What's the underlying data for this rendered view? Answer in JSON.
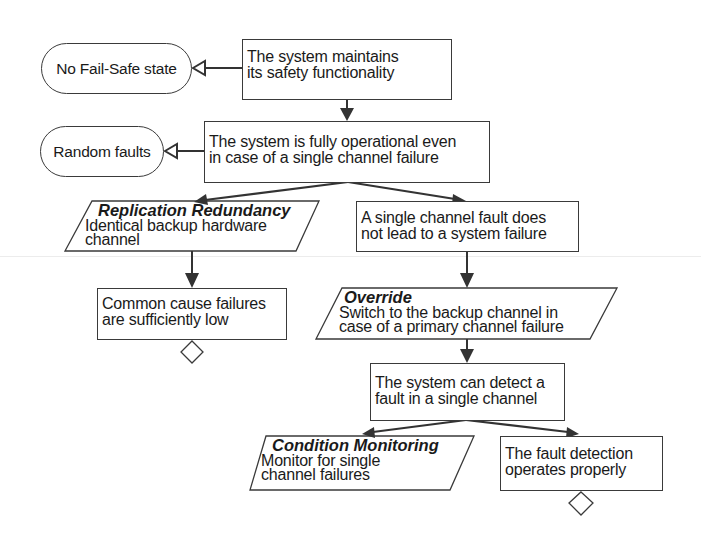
{
  "diagram": {
    "type": "safety-pattern-flowchart",
    "nodes": {
      "no_failsafe": {
        "label": "No Fail-Safe state",
        "shape": "terminator"
      },
      "random_faults": {
        "label": "Random faults",
        "shape": "terminator"
      },
      "maintains": {
        "line1": "The system maintains",
        "line2": "its safety functionality",
        "shape": "rectangle"
      },
      "fully_operational": {
        "line1": "The system is fully operational even",
        "line2": "in case of a single channel failure",
        "shape": "rectangle"
      },
      "replication": {
        "title": "Replication Redundancy",
        "line1": "Identical backup hardware",
        "line2": "channel",
        "shape": "parallelogram"
      },
      "single_fault": {
        "line1": "A single channel fault does",
        "line2": "not lead to a system failure",
        "shape": "rectangle"
      },
      "common_cause": {
        "line1": "Common cause failures",
        "line2": "are sufficiently low",
        "shape": "rectangle"
      },
      "override": {
        "title": "Override",
        "line1": "Switch to the backup channel in",
        "line2": "case of a primary channel failure",
        "shape": "parallelogram"
      },
      "detect": {
        "line1": "The system can detect a",
        "line2": "fault in a single channel",
        "shape": "rectangle"
      },
      "condition_monitoring": {
        "title": "Condition Monitoring",
        "line1": "Monitor for single",
        "line2": "channel failures",
        "shape": "parallelogram"
      },
      "fault_detection_ok": {
        "line1": "The fault detection",
        "line2": "operates properly",
        "shape": "rectangle"
      }
    },
    "edges": [
      {
        "from": "maintains",
        "to": "no_failsafe",
        "style": "hollow-triangle"
      },
      {
        "from": "maintains",
        "to": "fully_operational",
        "style": "filled-arrow"
      },
      {
        "from": "fully_operational",
        "to": "random_faults",
        "style": "hollow-triangle"
      },
      {
        "from": "fully_operational",
        "to": "replication",
        "style": "filled-arrow"
      },
      {
        "from": "fully_operational",
        "to": "single_fault",
        "style": "filled-arrow"
      },
      {
        "from": "replication",
        "to": "common_cause",
        "style": "filled-arrow"
      },
      {
        "from": "single_fault",
        "to": "override",
        "style": "filled-arrow"
      },
      {
        "from": "override",
        "to": "detect",
        "style": "filled-arrow"
      },
      {
        "from": "detect",
        "to": "condition_monitoring",
        "style": "filled-arrow"
      },
      {
        "from": "detect",
        "to": "fault_detection_ok",
        "style": "filled-arrow"
      }
    ],
    "undeveloped_markers": [
      "common_cause",
      "fault_detection_ok"
    ],
    "colors": {
      "stroke": "#3a3a3a",
      "fill": "#ffffff",
      "text": "#1a1a1a"
    }
  }
}
